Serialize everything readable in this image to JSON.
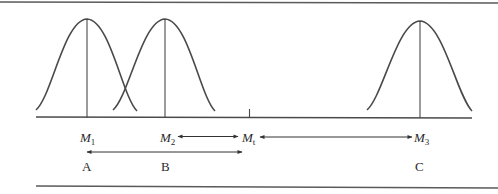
{
  "header": {
    "page_marker": "| Page |"
  },
  "diagram": {
    "curves": [
      {
        "id": "M1",
        "peak_x": 87
      },
      {
        "id": "M2",
        "peak_x": 165
      },
      {
        "id": "M3",
        "peak_x": 420
      }
    ],
    "tick_label": "Mt",
    "axis_labels": [
      {
        "symbol": "M",
        "subscript": "1"
      },
      {
        "symbol": "M",
        "subscript": "2"
      },
      {
        "symbol": "M",
        "subscript": "t"
      },
      {
        "symbol": "M",
        "subscript": "3"
      }
    ],
    "group_labels": [
      "A",
      "B",
      "C"
    ],
    "arrows": [
      {
        "from": "M2",
        "to": "Mt",
        "type": "double"
      },
      {
        "from": "Mt",
        "to": "M3",
        "type": "double"
      },
      {
        "from": "A",
        "to": "Mt",
        "type": "double"
      }
    ],
    "colors": {
      "line": "#4a4a4a",
      "text": "#2a2a2a"
    }
  }
}
